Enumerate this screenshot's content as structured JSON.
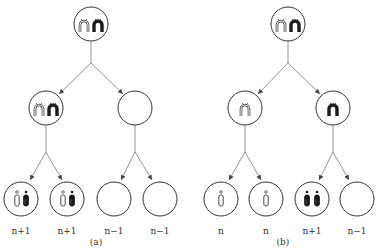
{
  "diagram": {
    "type": "meiotic nondisjunction tree",
    "panels": [
      {
        "caption": "(a)",
        "description": "Nondisjunction in meiosis I",
        "root": {
          "cell": "parent",
          "contents": "two homologous chromosomes (white + black), each with two chromatids"
        },
        "level2": [
          {
            "contents": "both homologs (white + black)"
          },
          {
            "contents": "empty"
          }
        ],
        "gametes": [
          {
            "label": "n+1",
            "contents": "white chromatid + black chromatid"
          },
          {
            "label": "n+1",
            "contents": "white chromatid + black chromatid"
          },
          {
            "label": "n−1",
            "contents": "empty"
          },
          {
            "label": "n−1",
            "contents": "empty"
          }
        ]
      },
      {
        "caption": "(b)",
        "description": "Nondisjunction in meiosis II",
        "root": {
          "cell": "parent",
          "contents": "two homologous chromosomes (white + black), each with two chromatids"
        },
        "level2": [
          {
            "contents": "white homolog"
          },
          {
            "contents": "black homolog"
          }
        ],
        "gametes": [
          {
            "label": "n",
            "contents": "white chromatid"
          },
          {
            "label": "n",
            "contents": "white chromatid"
          },
          {
            "label": "n+1",
            "contents": "two black chromatids"
          },
          {
            "label": "n−1",
            "contents": "empty"
          }
        ]
      }
    ]
  },
  "labels": {
    "a": [
      "n+1",
      "n+1",
      "n−1",
      "n−1"
    ],
    "b": [
      "n",
      "n",
      "n+1",
      "n−1"
    ],
    "caption_a": "(a)",
    "caption_b": "(b)"
  },
  "colors": {
    "stroke": "#333333",
    "fill_black": "#1a1a1a",
    "fill_white": "#ffffff",
    "line": "#666666"
  }
}
